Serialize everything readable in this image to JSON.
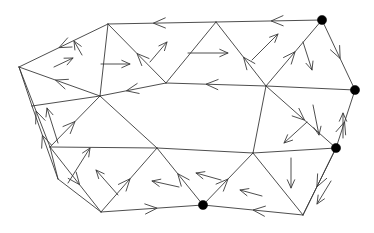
{
  "figure": {
    "width": 374,
    "height": 233,
    "background_color": "#ffffff",
    "edge_color": "#3a3a3a",
    "marked_vertex_color": "#000000",
    "edge_stroke_width": 0.9,
    "marked_vertex_radius": 4.6,
    "marked_vertex_count": 4,
    "vertex_count": 17,
    "edge_count": 36,
    "arrow_count": 29
  },
  "chart_data": {
    "type": "diagram",
    "xlabel": "",
    "ylabel": "",
    "xlim": [
      0,
      374
    ],
    "ylim": [
      0,
      233
    ],
    "grid": false,
    "legend": "none",
    "vertices": [
      {
        "id": "v0",
        "x": 19,
        "y": 67,
        "marked": false
      },
      {
        "id": "v1",
        "x": 108,
        "y": 24,
        "marked": false
      },
      {
        "id": "v2",
        "x": 216,
        "y": 22,
        "marked": false
      },
      {
        "id": "v3",
        "x": 322,
        "y": 20,
        "marked": true
      },
      {
        "id": "v4",
        "x": 355,
        "y": 90,
        "marked": true
      },
      {
        "id": "v5",
        "x": 336,
        "y": 148,
        "marked": true
      },
      {
        "id": "v6",
        "x": 303,
        "y": 215,
        "marked": false
      },
      {
        "id": "v7",
        "x": 203,
        "y": 205,
        "marked": true
      },
      {
        "id": "v8",
        "x": 101,
        "y": 212,
        "marked": false
      },
      {
        "id": "v9",
        "x": 50,
        "y": 147,
        "marked": false
      },
      {
        "id": "v10",
        "x": 100,
        "y": 96,
        "marked": false
      },
      {
        "id": "v11",
        "x": 166,
        "y": 83,
        "marked": false
      },
      {
        "id": "v12",
        "x": 266,
        "y": 86,
        "marked": false
      },
      {
        "id": "v13",
        "x": 157,
        "y": 148,
        "marked": false
      },
      {
        "id": "v14",
        "x": 253,
        "y": 153,
        "marked": false
      },
      {
        "id": "v15",
        "x": 32,
        "y": 106,
        "marked": false
      },
      {
        "id": "v16",
        "x": 58,
        "y": 179,
        "marked": false
      }
    ],
    "edges": [
      {
        "from": "v0",
        "to": "v1",
        "arrow": "backward",
        "arrow_t": 0.45
      },
      {
        "from": "v1",
        "to": "v2",
        "arrow": "backward",
        "arrow_t": 0.42
      },
      {
        "from": "v2",
        "to": "v3",
        "arrow": "backward",
        "arrow_t": 0.52
      },
      {
        "from": "v3",
        "to": "v4",
        "arrow": "forward",
        "arrow_t": 0.55
      },
      {
        "from": "v4",
        "to": "v5",
        "arrow": "backward",
        "arrow_t": 0.55
      },
      {
        "from": "v5",
        "to": "v6",
        "arrow": "forward",
        "arrow_t": 0.58
      },
      {
        "from": "v6",
        "to": "v7",
        "arrow": "forward",
        "arrow_t": 0.5
      },
      {
        "from": "v7",
        "to": "v8",
        "arrow": "backward",
        "arrow_t": 0.45
      },
      {
        "from": "v8",
        "to": "v9",
        "arrow": "backward",
        "arrow_t": 0.42
      },
      {
        "from": "v9",
        "to": "v0",
        "arrow": "forward",
        "arrow_t": 0.45
      },
      {
        "from": "v0",
        "to": "v10",
        "arrow": "backward",
        "arrow_t": 0.45
      },
      {
        "from": "v1",
        "to": "v10",
        "arrow": "none",
        "arrow_t": 0.5
      },
      {
        "from": "v1",
        "to": "v11",
        "arrow": "backward",
        "arrow_t": 0.5
      },
      {
        "from": "v10",
        "to": "v11",
        "arrow": "backward",
        "arrow_t": 0.4
      },
      {
        "from": "v11",
        "to": "v2",
        "arrow": "none",
        "arrow_t": 0.5
      },
      {
        "from": "v11",
        "to": "v12",
        "arrow": "backward",
        "arrow_t": 0.4
      },
      {
        "from": "v2",
        "to": "v12",
        "arrow": "backward",
        "arrow_t": 0.55
      },
      {
        "from": "v12",
        "to": "v3",
        "arrow": "forward",
        "arrow_t": 0.52
      },
      {
        "from": "v12",
        "to": "v4",
        "arrow": "none",
        "arrow_t": 0.5
      },
      {
        "from": "v12",
        "to": "v5",
        "arrow": "forward",
        "arrow_t": 0.55
      },
      {
        "from": "v12",
        "to": "v14",
        "arrow": "none",
        "arrow_t": 0.5
      },
      {
        "from": "v14",
        "to": "v5",
        "arrow": "none",
        "arrow_t": 0.5
      },
      {
        "from": "v14",
        "to": "v6",
        "arrow": "none",
        "arrow_t": 0.5
      },
      {
        "from": "v5",
        "to": "v6",
        "arrow": "none",
        "arrow_t": 0.5
      },
      {
        "from": "v14",
        "to": "v7",
        "arrow": "backward",
        "arrow_t": 0.5
      },
      {
        "from": "v13",
        "to": "v14",
        "arrow": "none",
        "arrow_t": 0.5
      },
      {
        "from": "v13",
        "to": "v7",
        "arrow": "backward",
        "arrow_t": 0.45
      },
      {
        "from": "v13",
        "to": "v8",
        "arrow": "backward",
        "arrow_t": 0.48
      },
      {
        "from": "v10",
        "to": "v13",
        "arrow": "none",
        "arrow_t": 0.5
      },
      {
        "from": "v9",
        "to": "v13",
        "arrow": "none",
        "arrow_t": 0.5
      },
      {
        "from": "v10",
        "to": "v9",
        "arrow": "backward",
        "arrow_t": 0.5
      },
      {
        "from": "v0",
        "to": "v15",
        "arrow": "none",
        "arrow_t": 0.5
      },
      {
        "from": "v15",
        "to": "v16",
        "arrow": "backward",
        "arrow_t": 0.4
      },
      {
        "from": "v15",
        "to": "v10",
        "arrow": "none",
        "arrow_t": 0.5
      },
      {
        "from": "v9",
        "to": "v16",
        "arrow": "none",
        "arrow_t": 0.5
      },
      {
        "from": "v16",
        "to": "v8",
        "arrow": "none",
        "arrow_t": 0.5
      }
    ],
    "standalone_arrows": [
      {
        "id": "a1",
        "x1": 82,
        "y1": 55,
        "x2": 74,
        "y2": 41,
        "label": "interior-up-left"
      },
      {
        "id": "a2",
        "x1": 150,
        "y1": 62,
        "x2": 167,
        "y2": 42,
        "label": "interior-up-right"
      },
      {
        "id": "a3",
        "x1": 101,
        "y1": 64,
        "x2": 130,
        "y2": 64,
        "label": "interior-right"
      },
      {
        "id": "a4",
        "x1": 188,
        "y1": 53,
        "x2": 228,
        "y2": 53,
        "label": "interior-right-2"
      },
      {
        "id": "a5",
        "x1": 252,
        "y1": 60,
        "x2": 278,
        "y2": 34,
        "label": "interior-up-right-2"
      },
      {
        "id": "a6",
        "x1": 303,
        "y1": 42,
        "x2": 312,
        "y2": 70,
        "label": "interior-down"
      },
      {
        "id": "a7",
        "x1": 313,
        "y1": 105,
        "x2": 319,
        "y2": 135,
        "label": "interior-down-2"
      },
      {
        "id": "a8",
        "x1": 307,
        "y1": 122,
        "x2": 284,
        "y2": 143,
        "label": "interior-down-left"
      },
      {
        "id": "a9",
        "x1": 291,
        "y1": 158,
        "x2": 291,
        "y2": 188,
        "label": "interior-down-3"
      },
      {
        "id": "a10",
        "x1": 331,
        "y1": 181,
        "x2": 317,
        "y2": 204,
        "label": "interior-down-left-2"
      },
      {
        "id": "a11",
        "x1": 343,
        "y1": 138,
        "x2": 343,
        "y2": 113,
        "label": "interior-up"
      },
      {
        "id": "a12",
        "x1": 262,
        "y1": 196,
        "x2": 240,
        "y2": 190,
        "label": "interior-left"
      },
      {
        "id": "a13",
        "x1": 221,
        "y1": 180,
        "x2": 196,
        "y2": 173,
        "label": "interior-left-2"
      },
      {
        "id": "a14",
        "x1": 179,
        "y1": 187,
        "x2": 152,
        "y2": 181,
        "label": "interior-left-3"
      },
      {
        "id": "a15",
        "x1": 118,
        "y1": 195,
        "x2": 96,
        "y2": 170,
        "label": "interior-up-left-2"
      },
      {
        "id": "a16",
        "x1": 68,
        "y1": 183,
        "x2": 90,
        "y2": 148,
        "label": "interior-up-right-3"
      },
      {
        "id": "a17",
        "x1": 58,
        "y1": 143,
        "x2": 47,
        "y2": 108,
        "label": "interior-up-left-3"
      },
      {
        "id": "a18",
        "x1": 54,
        "y1": 67,
        "x2": 73,
        "y2": 58,
        "label": "interior-up-right-4"
      }
    ]
  }
}
